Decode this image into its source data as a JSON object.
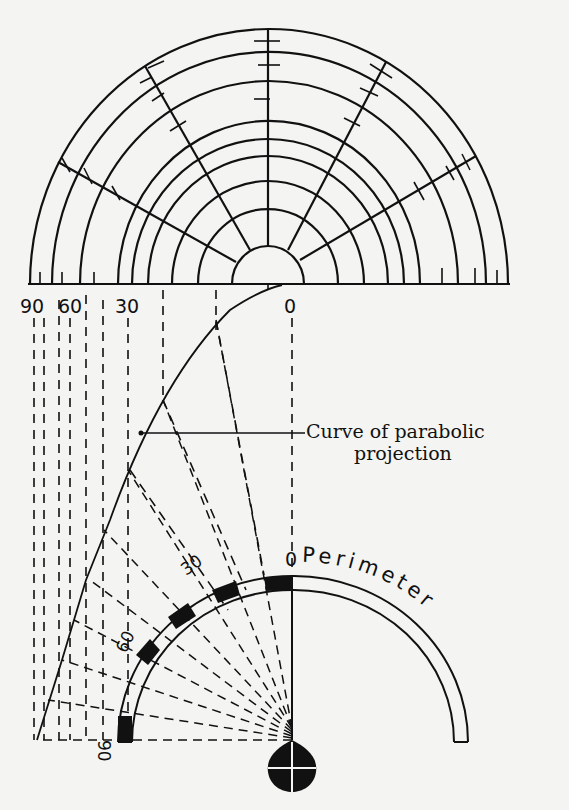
{
  "figure": {
    "top_polar_grid": {
      "ring_count": 10,
      "radial_lines": 4,
      "baseline_labels": [
        "90",
        "60",
        "30",
        "0"
      ]
    },
    "curve_label": {
      "line1": "Curve of parabolic",
      "line2": "projection"
    },
    "perimeter": {
      "title": "Perimeter",
      "scale_labels": [
        "0",
        "30",
        "60",
        "90"
      ]
    },
    "colors": {
      "ink": "#111111",
      "paper": "#f4f4f2"
    }
  }
}
